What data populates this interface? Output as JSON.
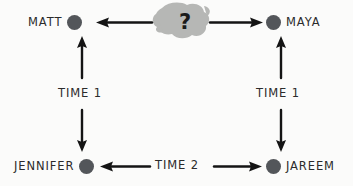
{
  "diagram": {
    "type": "node-link-diagram",
    "title": "",
    "style": "hand-drawn",
    "background_color": "#fbfbfa",
    "node_dot_color": "#53565a",
    "arrow_color": "#141414",
    "blob_color": "#b6b7b5",
    "nodes": [
      {
        "id": "matt",
        "label": "MATT",
        "label_side": "left",
        "x": 80,
        "y": 22
      },
      {
        "id": "unknown",
        "label": "?",
        "shape": "blob",
        "x": 179,
        "y": 21
      },
      {
        "id": "maya",
        "label": "MAYA",
        "label_side": "right",
        "x": 272,
        "y": 22
      },
      {
        "id": "jennifer",
        "label": "JENNIFER",
        "label_side": "left",
        "x": 80,
        "y": 166
      },
      {
        "id": "jareem",
        "label": "JAREEM",
        "label_side": "right",
        "x": 272,
        "y": 166
      }
    ],
    "edge_labels": [
      {
        "id": "time-1-left",
        "text": "TIME 1",
        "x": 82,
        "y": 96
      },
      {
        "id": "time-1-right",
        "text": "TIME 1",
        "x": 277,
        "y": 96
      },
      {
        "id": "time-2-bottom",
        "text": "TIME 2",
        "x": 176,
        "y": 166
      }
    ],
    "edges": [
      {
        "id": "unknown-to-matt",
        "from": "unknown",
        "to": "matt",
        "direction": "left"
      },
      {
        "id": "unknown-to-maya",
        "from": "unknown",
        "to": "maya",
        "direction": "right"
      },
      {
        "id": "jennifer-to-matt",
        "from": "jennifer",
        "to": "matt",
        "direction": "up",
        "label": "TIME 1"
      },
      {
        "id": "matt-to-jennifer",
        "from": "matt",
        "to": "jennifer",
        "direction": "down",
        "label": "TIME 1"
      },
      {
        "id": "jareem-to-maya",
        "from": "jareem",
        "to": "maya",
        "direction": "up",
        "label": "TIME 1"
      },
      {
        "id": "maya-to-jareem",
        "from": "maya",
        "to": "jareem",
        "direction": "down",
        "label": "TIME 1"
      },
      {
        "id": "time2-to-jennifer",
        "from": "time-2",
        "to": "jennifer",
        "direction": "left",
        "label": "TIME 2"
      },
      {
        "id": "time2-to-jareem",
        "from": "time-2",
        "to": "jareem",
        "direction": "right",
        "label": "TIME 2"
      }
    ]
  }
}
